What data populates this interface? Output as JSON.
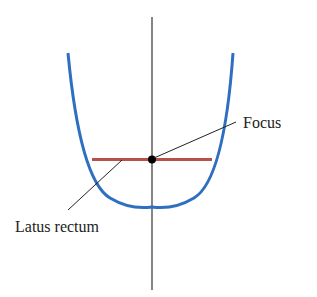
{
  "diagram": {
    "type": "parabola-latus-rectum",
    "labels": {
      "focus": "Focus",
      "latus_rectum": "Latus rectum"
    },
    "colors": {
      "parabola": "#2e6fc0",
      "latus_rectum": "#b5524a",
      "axis": "#333333",
      "focus_point": "#000000"
    }
  }
}
